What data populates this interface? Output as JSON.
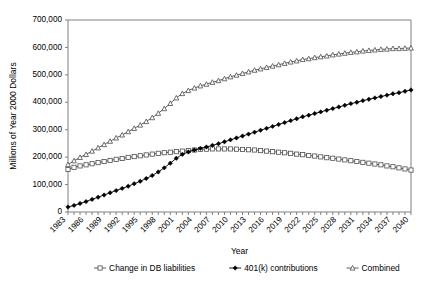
{
  "chart_data": {
    "type": "line",
    "title": "",
    "xlabel": "Year",
    "ylabel": "Millions of Year 2000 Dollars",
    "grid": false,
    "legend_position": "bottom",
    "xlim": [
      1983,
      2040
    ],
    "ylim": [
      0,
      700000
    ],
    "ytick_labels": [
      "0",
      "100,000",
      "200,000",
      "300,000",
      "400,000",
      "500,000",
      "600,000",
      "700,000"
    ],
    "ytick_values": [
      0,
      100000,
      200000,
      300000,
      400000,
      500000,
      600000,
      700000
    ],
    "xtick_labels": [
      "1983",
      "1986",
      "1989",
      "1992",
      "1995",
      "1998",
      "2001",
      "2004",
      "2007",
      "2010",
      "2013",
      "2016",
      "2019",
      "2022",
      "2025",
      "2028",
      "2031",
      "2034",
      "2037",
      "2040"
    ],
    "xtick_values": [
      1983,
      1986,
      1989,
      1992,
      1995,
      1998,
      2001,
      2004,
      2007,
      2010,
      2013,
      2016,
      2019,
      2022,
      2025,
      2028,
      2031,
      2034,
      2037,
      2040
    ],
    "x": [
      1983,
      1984,
      1985,
      1986,
      1987,
      1988,
      1989,
      1990,
      1991,
      1992,
      1993,
      1994,
      1995,
      1996,
      1997,
      1998,
      1999,
      2000,
      2001,
      2002,
      2003,
      2004,
      2005,
      2006,
      2007,
      2008,
      2009,
      2010,
      2011,
      2012,
      2013,
      2014,
      2015,
      2016,
      2017,
      2018,
      2019,
      2020,
      2021,
      2022,
      2023,
      2024,
      2025,
      2026,
      2027,
      2028,
      2029,
      2030,
      2031,
      2032,
      2033,
      2034,
      2035,
      2036,
      2037,
      2038,
      2039,
      2040
    ],
    "series": [
      {
        "name": "Change in DB liabilities",
        "marker": "open-square",
        "color": "#4d4d4d",
        "values": [
          155000,
          163000,
          168000,
          172000,
          176000,
          180000,
          184000,
          188000,
          192000,
          195000,
          199000,
          202000,
          205000,
          208000,
          211000,
          214000,
          216000,
          218000,
          220000,
          222000,
          224000,
          226000,
          228000,
          229000,
          230000,
          230000,
          230000,
          230000,
          229000,
          228000,
          227000,
          226000,
          224000,
          222000,
          220000,
          218000,
          216000,
          214000,
          211000,
          209000,
          206000,
          204000,
          201000,
          198000,
          196000,
          193000,
          190000,
          187000,
          184000,
          181000,
          178000,
          175000,
          172000,
          168000,
          165000,
          161000,
          157000,
          153000
        ]
      },
      {
        "name": "401(k) contributions",
        "marker": "solid-diamond",
        "color": "#000000",
        "values": [
          18000,
          24000,
          31000,
          38000,
          46000,
          54000,
          62000,
          70000,
          78000,
          86000,
          94000,
          103000,
          112000,
          122000,
          133000,
          146000,
          161000,
          178000,
          196000,
          210000,
          219000,
          226000,
          232000,
          237000,
          243000,
          249000,
          256000,
          263000,
          270000,
          277000,
          284000,
          291000,
          298000,
          305000,
          312000,
          319000,
          326000,
          333000,
          340000,
          347000,
          353000,
          359000,
          365000,
          371000,
          377000,
          383000,
          389000,
          395000,
          400000,
          406000,
          411000,
          416000,
          421000,
          426000,
          431000,
          435000,
          440000,
          445000
        ]
      },
      {
        "name": "Combined",
        "marker": "open-triangle",
        "color": "#4d4d4d",
        "values": [
          173000,
          187000,
          199000,
          210000,
          222000,
          234000,
          246000,
          258000,
          270000,
          281000,
          293000,
          305000,
          317000,
          330000,
          344000,
          360000,
          377000,
          396000,
          416000,
          432000,
          443000,
          452000,
          460000,
          466000,
          473000,
          479000,
          486000,
          493000,
          499000,
          505000,
          511000,
          517000,
          522000,
          527000,
          532000,
          537000,
          542000,
          547000,
          551000,
          556000,
          559000,
          563000,
          566000,
          569000,
          573000,
          576000,
          579000,
          582000,
          584000,
          587000,
          589000,
          591000,
          593000,
          594000,
          596000,
          596000,
          597000,
          598000
        ]
      }
    ]
  },
  "legend": {
    "items": [
      {
        "label": "Change in DB liabilities",
        "marker": "open-square"
      },
      {
        "label": "401(k) contributions",
        "marker": "solid-diamond"
      },
      {
        "label": "Combined",
        "marker": "open-triangle"
      }
    ]
  }
}
